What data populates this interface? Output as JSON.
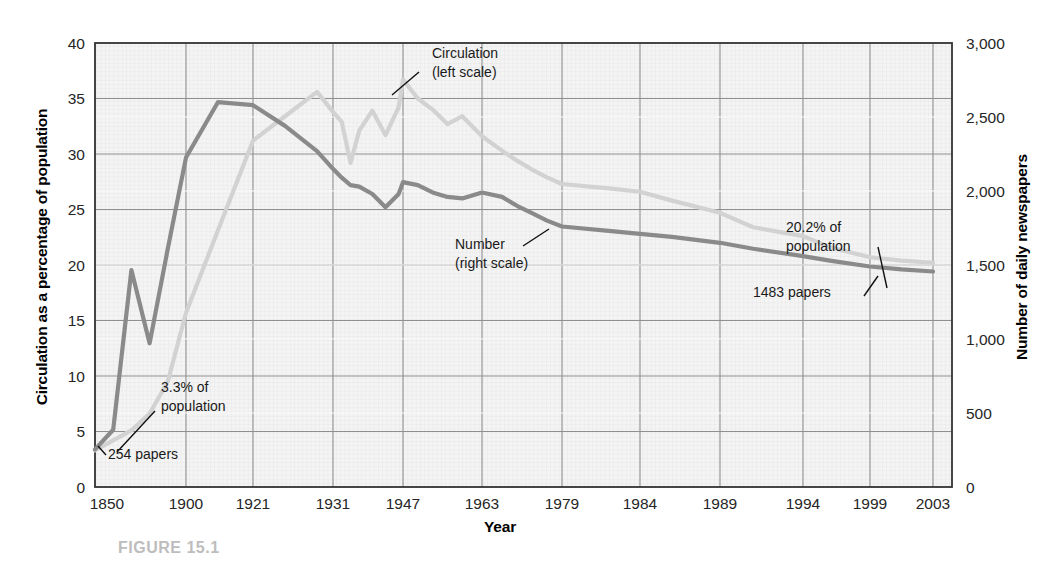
{
  "figure": {
    "caption": "FIGURE 15.1"
  },
  "axes": {
    "left_title": "Circulation as a percentage of population",
    "right_title": "Number of daily newspapers",
    "x_title": "Year"
  },
  "chart_data": {
    "type": "line",
    "title": "",
    "xlabel": "Year",
    "ylabel": "Circulation as a percentage of population",
    "y2label": "Number of daily newspapers",
    "grid": true,
    "legend": "inline-annotations",
    "xlim": [
      1850,
      2003
    ],
    "ylim": [
      0,
      40
    ],
    "y2lim": [
      0,
      3000
    ],
    "x_tick_labels": [
      "1850",
      "1900",
      "1921",
      "1931",
      "1947",
      "1963",
      "1979",
      "1984",
      "1989",
      "1994",
      "1999",
      "2003"
    ],
    "x_tick_values": [
      1850,
      1900,
      1921,
      1931,
      1947,
      1963,
      1979,
      1984,
      1989,
      1994,
      1999,
      2003
    ],
    "x_tick_pixels": [
      95,
      186,
      253,
      333,
      403,
      482,
      562,
      640,
      720,
      803,
      870,
      933
    ],
    "y_tick_labels": [
      "0",
      "5",
      "10",
      "15",
      "20",
      "25",
      "30",
      "35",
      "40"
    ],
    "y_tick_values": [
      0,
      5,
      10,
      15,
      20,
      25,
      30,
      35,
      40
    ],
    "y2_tick_labels": [
      "0",
      "500",
      "1,000",
      "1,500",
      "2,000",
      "2,500",
      "3,000"
    ],
    "y2_tick_values": [
      0,
      500,
      1000,
      1500,
      2000,
      2500,
      3000
    ],
    "series": [
      {
        "name": "Circulation (left scale)",
        "axis": "left",
        "color": "#d2d2d2",
        "x": [
          1850,
          1860,
          1870,
          1880,
          1890,
          1900,
          1910,
          1921,
          1925,
          1929,
          1931,
          1933,
          1935,
          1937,
          1940,
          1943,
          1946,
          1947,
          1950,
          1953,
          1956,
          1959,
          1963,
          1967,
          1970,
          1973,
          1976,
          1979,
          1982,
          1984,
          1986,
          1989,
          1991,
          1994,
          1996,
          1999,
          2001,
          2003
        ],
        "y": [
          3.3,
          4.2,
          5.1,
          6.6,
          9.5,
          15.7,
          23.1,
          31.2,
          33.4,
          35.6,
          33.8,
          32.9,
          29.2,
          32.1,
          33.9,
          31.7,
          34.2,
          36.7,
          35.0,
          34.0,
          32.7,
          33.4,
          31.6,
          30.3,
          29.4,
          28.6,
          27.9,
          27.3,
          26.9,
          26.6,
          25.8,
          24.7,
          23.4,
          22.6,
          21.6,
          20.7,
          20.4,
          20.2
        ],
        "start_value_label": "3.3% of population",
        "end_value_label": "20.2% of population"
      },
      {
        "name": "Number (right scale)",
        "axis": "right",
        "color": "#8a8a8a",
        "x": [
          1850,
          1860,
          1870,
          1880,
          1890,
          1900,
          1910,
          1921,
          1925,
          1929,
          1931,
          1933,
          1935,
          1937,
          1940,
          1943,
          1946,
          1947,
          1950,
          1953,
          1956,
          1959,
          1963,
          1967,
          1970,
          1973,
          1976,
          1979,
          1982,
          1984,
          1986,
          1989,
          1991,
          1994,
          1996,
          1999,
          2001,
          2003
        ],
        "y": [
          254,
          387,
          1466,
          971,
          1610,
          2226,
          2600,
          2580,
          2440,
          2270,
          2150,
          2090,
          2040,
          2030,
          1980,
          1890,
          1980,
          2060,
          2040,
          1990,
          1960,
          1950,
          1990,
          1960,
          1900,
          1850,
          1800,
          1760,
          1730,
          1710,
          1690,
          1650,
          1610,
          1560,
          1530,
          1490,
          1470,
          1456
        ],
        "start_value_label": "254 papers",
        "end_value_label": "1483 papers"
      }
    ]
  },
  "annotations": [
    {
      "id": "circulation-callout",
      "line1": "Circulation",
      "line2": "(left scale)",
      "x": 432,
      "y": 58
    },
    {
      "id": "number-callout",
      "line1": "Number",
      "line2": "(right scale)",
      "x": 455,
      "y": 249
    },
    {
      "id": "start-circulation-callout",
      "line1": "3.3% of",
      "line2": "population",
      "x": 161,
      "y": 392
    },
    {
      "id": "start-number-callout",
      "line1": "254 papers",
      "line2": "",
      "x": 108,
      "y": 459
    },
    {
      "id": "end-circulation-callout",
      "line1": "20.2% of",
      "line2": "population",
      "x": 786,
      "y": 232
    },
    {
      "id": "end-number-callout",
      "line1": "1483 papers",
      "line2": "",
      "x": 753,
      "y": 297
    }
  ]
}
